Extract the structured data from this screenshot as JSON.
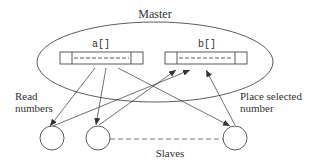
{
  "diagram": {
    "title": "Master",
    "arrays": [
      {
        "label": "a[]"
      },
      {
        "label": "b[]"
      }
    ],
    "annotations": {
      "left_line1": "Read",
      "left_line2": "numbers",
      "right_line1": "Place selected",
      "right_line2": "number"
    },
    "slaves_label": "Slaves",
    "colors": {
      "stroke": "#333333",
      "background": "#ffffff"
    }
  }
}
